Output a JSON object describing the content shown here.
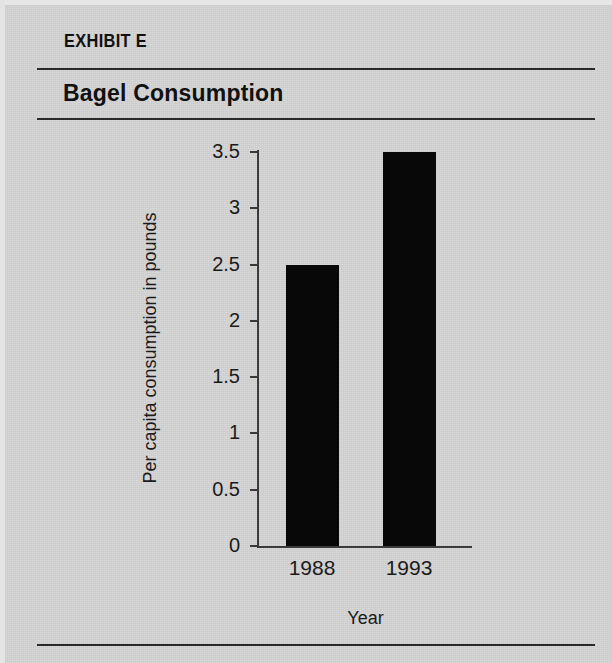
{
  "document": {
    "exhibit_label": "EXHIBIT E",
    "title": "Bagel Consumption"
  },
  "colors": {
    "background": "#d3d3d3",
    "rule": "#2b2b2b",
    "bar": "#080808",
    "axis": "#3a3a3a",
    "text": "#1b1b1b"
  },
  "chart_data": {
    "type": "bar",
    "title": "Bagel Consumption",
    "subtitle": "",
    "categories": [
      "1988",
      "1993"
    ],
    "values": [
      2.5,
      3.5
    ],
    "xlabel": "Year",
    "ylabel": "Per capita consumption in pounds",
    "ylim": [
      0,
      3.5
    ],
    "ytick_labels": [
      "0",
      "0.5",
      "1",
      "1.5",
      "2",
      "2.5",
      "3",
      "3.5"
    ],
    "ytick_values": [
      0,
      0.5,
      1,
      1.5,
      2,
      2.5,
      3,
      3.5
    ],
    "grid": false,
    "legend": false,
    "series": [
      {
        "name": "Per capita consumption in pounds",
        "values": [
          2.5,
          3.5
        ]
      }
    ]
  }
}
